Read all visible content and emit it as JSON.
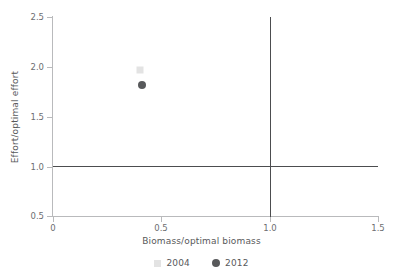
{
  "chart_data": {
    "type": "scatter",
    "title": "",
    "subtitle": "",
    "xlabel": "Biomass/optimal biomass",
    "ylabel": "Effort/optimal effort",
    "xlim": [
      0,
      1.5
    ],
    "ylim": [
      0.5,
      2.5
    ],
    "xticks": [
      "0",
      "0.5",
      "1.0",
      "1.5"
    ],
    "xtick_values": [
      0,
      0.5,
      1.0,
      1.5
    ],
    "yticks": [
      "0.5",
      "1.0",
      "1.5",
      "2.0",
      "2.5"
    ],
    "ytick_values": [
      0.5,
      1.0,
      1.5,
      2.0,
      2.5
    ],
    "grid": false,
    "legend_position": "bottom",
    "reference_lines": [
      {
        "name": "biomass-reference",
        "orientation": "vertical",
        "value": 1.0,
        "color": "#4c4d4f"
      },
      {
        "name": "effort-reference",
        "orientation": "horizontal",
        "value": 1.0,
        "color": "#4c4d4f"
      }
    ],
    "series": [
      {
        "name": "2004",
        "marker": "square",
        "color": "#e3e3e3",
        "points": [
          {
            "x": 0.4,
            "y": 1.97
          }
        ]
      },
      {
        "name": "2012",
        "marker": "circle",
        "color": "#58595b",
        "points": [
          {
            "x": 0.41,
            "y": 1.82
          }
        ]
      }
    ],
    "legend": [
      {
        "label": "2004",
        "marker": "square",
        "color": "#e3e3e3"
      },
      {
        "label": "2012",
        "marker": "circle",
        "color": "#58595b"
      }
    ]
  },
  "axes": {
    "x": {
      "title": "Biomass/optimal biomass",
      "ticks": [
        {
          "label": "0",
          "value": 0
        },
        {
          "label": "0.5",
          "value": 0.5
        },
        {
          "label": "1.0",
          "value": 1.0
        },
        {
          "label": "1.5",
          "value": 1.5
        }
      ]
    },
    "y": {
      "title": "Effort/optimal effort",
      "ticks": [
        {
          "label": "2.5",
          "value": 2.5
        },
        {
          "label": "2.0",
          "value": 2.0
        },
        {
          "label": "1.5",
          "value": 1.5
        },
        {
          "label": "1.0",
          "value": 1.0
        },
        {
          "label": "0.5",
          "value": 0.5
        }
      ]
    }
  },
  "colors": {
    "axis": "#b9babc",
    "reference": "#4c4d4f",
    "text": "#58595b",
    "tick_text": "#6d6e71",
    "series_2004": "#e3e3e3",
    "series_2012": "#58595b",
    "background": "#ffffff"
  }
}
